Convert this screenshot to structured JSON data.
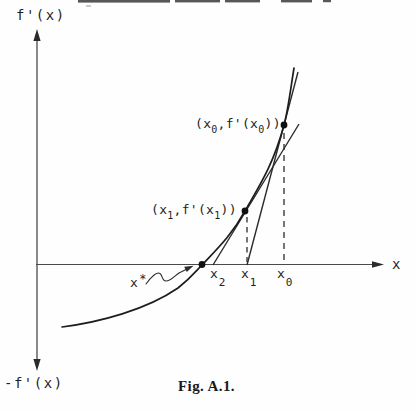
{
  "figure": {
    "axes": {
      "y_axis_top_label": "f'(x)",
      "y_axis_bottom_label": "-f'(x)",
      "x_axis_label": "x"
    },
    "annotations": {
      "p0": {
        "open": "(x",
        "sub_a": "0",
        "mid": ",f'(x",
        "sub_b": "0",
        "close": "))"
      },
      "p1": {
        "open": "(x",
        "sub_a": "1",
        "mid": ",f'(x",
        "sub_b": "1",
        "close": "))"
      },
      "x_star": {
        "base": "x",
        "sup": "*"
      }
    },
    "x_ticks": [
      {
        "base": "x",
        "sub": "2"
      },
      {
        "base": "x",
        "sub": "1"
      },
      {
        "base": "x",
        "sub": "0"
      }
    ],
    "caption": "Fig. A.1."
  },
  "colors": {
    "ink": "#1f1f1f",
    "axis": "#4a4a4a",
    "background": "#fefefe"
  }
}
